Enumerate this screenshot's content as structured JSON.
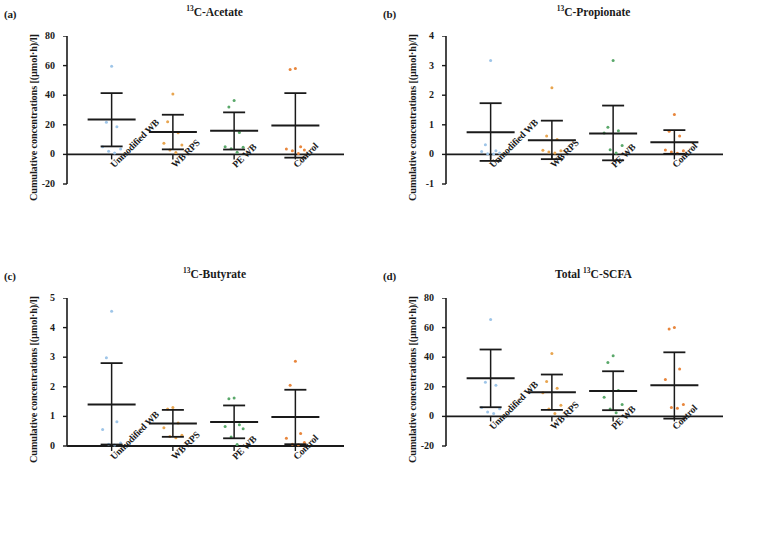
{
  "figure": {
    "width": 758,
    "height": 556,
    "background": "#ffffff",
    "axis_color": "#1a1a1a",
    "group_colors": {
      "unmodified_wb": "#9ec5e8",
      "wb_rps": "#e8a54f",
      "pe_wb": "#5aa86a",
      "control": "#e8863c"
    }
  },
  "chart_data": [
    {
      "panel": "a",
      "type": "scatter",
      "title": "13C-Acetate",
      "title_prefix": "",
      "title_sup": "13",
      "title_rest": "C-Acetate",
      "xlabel": "",
      "ylabel": "Cumulative concentrations [(µmol·h)/l]",
      "categories": [
        "Unmodified WB",
        "WB RPS",
        "PE WB",
        "Control"
      ],
      "yticks": [
        -20,
        0,
        20,
        40,
        60,
        80
      ],
      "ylim": [
        -20,
        80
      ],
      "grid": false,
      "legend": "none",
      "series": [
        {
          "name": "Unmodified WB",
          "color": "#9ec5e8",
          "mean": 23.5,
          "err_low": 5.4,
          "err_high": 41.4,
          "points": [
            59.5,
            21.8,
            18.6,
            5.2,
            3.6,
            2.1,
            1.0
          ]
        },
        {
          "name": "WB RPS",
          "color": "#e8a54f",
          "mean": 15.1,
          "err_low": 3.4,
          "err_high": 26.8,
          "points": [
            40.8,
            22.0,
            14.6,
            7.6,
            6.3,
            3.0,
            1.2
          ]
        },
        {
          "name": "PE WB",
          "color": "#5aa86a",
          "mean": 16.0,
          "err_low": 3.3,
          "err_high": 28.4,
          "points": [
            36.5,
            32.0,
            14.8,
            5.2,
            4.8,
            3.8,
            1.5
          ]
        },
        {
          "name": "Control",
          "color": "#e8863c",
          "mean": 19.6,
          "err_low": -2.2,
          "err_high": 41.4,
          "points": [
            58.0,
            57.4,
            5.1,
            3.6,
            2.9,
            2.4,
            0.6
          ]
        }
      ]
    },
    {
      "panel": "b",
      "type": "scatter",
      "title": "13C-Propionate",
      "title_sup": "13",
      "title_rest": "C-Propionate",
      "xlabel": "",
      "ylabel": "Cumulative concentrations [(µmol·h)/l]",
      "categories": [
        "Unmodified WB",
        "WB RPS",
        "PE WB",
        "Control"
      ],
      "yticks": [
        -1,
        0,
        1,
        2,
        3,
        4
      ],
      "ylim": [
        -1,
        4
      ],
      "grid": false,
      "legend": "none",
      "series": [
        {
          "name": "Unmodified WB",
          "color": "#9ec5e8",
          "mean": 0.75,
          "err_low": -0.22,
          "err_high": 1.73,
          "points": [
            3.17,
            0.33,
            0.12,
            0.1,
            0.05,
            0.02,
            0.01
          ]
        },
        {
          "name": "WB RPS",
          "color": "#e8a54f",
          "mean": 0.48,
          "err_low": -0.16,
          "err_high": 1.14,
          "points": [
            2.25,
            0.62,
            0.5,
            0.14,
            0.12,
            0.08,
            0.05
          ]
        },
        {
          "name": "PE WB",
          "color": "#5aa86a",
          "mean": 0.71,
          "err_low": -0.2,
          "err_high": 1.65,
          "points": [
            3.17,
            0.92,
            0.8,
            0.72,
            0.3,
            0.16,
            0.05
          ]
        },
        {
          "name": "Control",
          "color": "#e8863c",
          "mean": 0.41,
          "err_low": 0.02,
          "err_high": 0.82,
          "points": [
            1.35,
            0.78,
            0.62,
            0.15,
            0.12,
            0.08,
            0.04
          ]
        }
      ]
    },
    {
      "panel": "c",
      "type": "scatter",
      "title": "13C-Butyrate",
      "title_sup": "13",
      "title_rest": "C-Butyrate",
      "xlabel": "",
      "ylabel": "Cumulative concentrations [(µmol·h)/l]",
      "categories": [
        "Unmodified WB",
        "WB RPS",
        "PE WB",
        "Control"
      ],
      "yticks": [
        0,
        1,
        2,
        3,
        4,
        5
      ],
      "ylim": [
        0,
        5
      ],
      "grid": false,
      "legend": "none",
      "series": [
        {
          "name": "Unmodified WB",
          "color": "#9ec5e8",
          "mean": 1.4,
          "err_low": 0.05,
          "err_high": 2.8,
          "points": [
            4.55,
            2.98,
            0.82,
            0.56,
            0.1,
            0.06,
            0.03
          ]
        },
        {
          "name": "WB RPS",
          "color": "#e8a54f",
          "mean": 0.76,
          "err_low": 0.31,
          "err_high": 1.22,
          "points": [
            1.3,
            1.25,
            0.78,
            0.62,
            0.36,
            0.32,
            0.28
          ]
        },
        {
          "name": "PE WB",
          "color": "#5aa86a",
          "mean": 0.81,
          "err_low": 0.26,
          "err_high": 1.37,
          "points": [
            1.62,
            1.6,
            0.72,
            0.66,
            0.58,
            0.3,
            0.05
          ]
        },
        {
          "name": "Control",
          "color": "#e8863c",
          "mean": 0.98,
          "err_low": 0.06,
          "err_high": 1.9,
          "points": [
            2.86,
            2.05,
            0.42,
            0.26,
            0.12,
            0.06,
            0.04
          ]
        }
      ]
    },
    {
      "panel": "d",
      "type": "scatter",
      "title": "Total 13C-SCFA",
      "title_prefix": "Total ",
      "title_sup": "13",
      "title_rest": "C-SCFA",
      "xlabel": "",
      "ylabel": "Cumulative concentrations [(µmol·h)/l]",
      "categories": [
        "Unmodified WB",
        "WB RPS",
        "PE WB",
        "Control"
      ],
      "yticks": [
        -20,
        0,
        20,
        40,
        60,
        80
      ],
      "ylim": [
        -20,
        80
      ],
      "grid": false,
      "legend": "none",
      "series": [
        {
          "name": "Unmodified WB",
          "color": "#9ec5e8",
          "mean": 25.8,
          "err_low": 6.2,
          "err_high": 45.2,
          "points": [
            65.5,
            23.0,
            21.0,
            6.0,
            5.2,
            3.0,
            2.0
          ]
        },
        {
          "name": "WB RPS",
          "color": "#e8a54f",
          "mean": 16.3,
          "err_low": 4.4,
          "err_high": 28.3,
          "points": [
            42.5,
            23.5,
            19.0,
            16.0,
            7.5,
            5.0,
            2.0
          ]
        },
        {
          "name": "PE WB",
          "color": "#5aa86a",
          "mean": 17.2,
          "err_low": 4.2,
          "err_high": 30.5,
          "points": [
            41.0,
            36.5,
            17.5,
            13.0,
            8.0,
            5.0,
            2.5
          ]
        },
        {
          "name": "Control",
          "color": "#e8863c",
          "mean": 21.0,
          "err_low": -1.5,
          "err_high": 43.3,
          "points": [
            60.0,
            59.0,
            32.0,
            25.0,
            8.0,
            6.0,
            5.5
          ]
        }
      ]
    }
  ],
  "panels": [
    {
      "id": "a",
      "label": "(a)"
    },
    {
      "id": "b",
      "label": "(b)"
    },
    {
      "id": "c",
      "label": "(c)"
    },
    {
      "id": "d",
      "label": "(d)"
    }
  ]
}
